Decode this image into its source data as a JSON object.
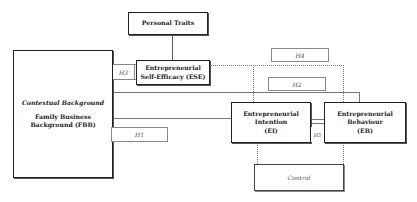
{
  "diagram": {
    "nodes": {
      "personal_traits": {
        "label": "Personal Traits"
      },
      "contextual_background": {
        "title": "Contextual Background",
        "line1": "Family Business",
        "line2": "Background (FBB)"
      },
      "ese": {
        "line1": "Entrepreneurial",
        "line2": "Self-Efficacy (ESE)"
      },
      "ei": {
        "line1": "Entrepreneurial",
        "line2": "Intention",
        "line3": "(EI)"
      },
      "eb": {
        "line1": "Entrepreneurial",
        "line2": "Behaviour",
        "line3": "(EB)"
      },
      "control": {
        "label": "Control"
      }
    },
    "hypotheses": {
      "h1": "H1",
      "h2": "H2",
      "h3": "H3",
      "h4": "H4",
      "h5": "H5"
    },
    "edges": [
      {
        "from": "personal_traits",
        "to": "ese",
        "style": "solid"
      },
      {
        "from": "contextual_background",
        "to": "ese",
        "label": "H3",
        "style": "solid"
      },
      {
        "from": "contextual_background",
        "to": "ei",
        "label": "H1",
        "style": "solid"
      },
      {
        "from": "contextual_background",
        "to": "eb",
        "label": "H2",
        "style": "solid"
      },
      {
        "from": "ese",
        "to": "ei",
        "label": "H4",
        "style": "dotted"
      },
      {
        "from": "ese",
        "to": "eb",
        "label": "H4",
        "style": "dotted"
      },
      {
        "from": "ei",
        "to": "eb",
        "label": "H5",
        "style": "solid"
      },
      {
        "from": "control",
        "to": "ei",
        "style": "dotted"
      },
      {
        "from": "control",
        "to": "eb",
        "style": "dotted"
      }
    ]
  }
}
